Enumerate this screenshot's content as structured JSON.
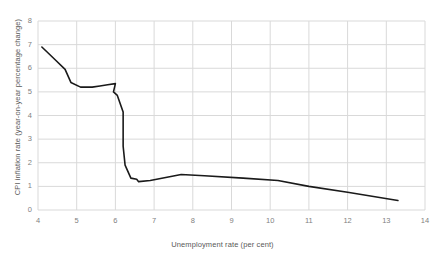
{
  "chart_data": {
    "type": "line",
    "title": "",
    "xlabel": "Unemployment rate (per cent)",
    "ylabel": "CPI inflation rate (year-on-year percentage change)",
    "xlim": [
      4,
      14
    ],
    "ylim": [
      0,
      8
    ],
    "xticks": [
      4,
      5,
      6,
      7,
      8,
      9,
      10,
      11,
      12,
      13,
      14
    ],
    "yticks": [
      0,
      1,
      2,
      3,
      4,
      5,
      6,
      7,
      8
    ],
    "grid": "both",
    "legend": "none",
    "series": [
      {
        "name": "CPI inflation vs unemployment",
        "color": "#1a1a1a",
        "points": [
          {
            "x": 4.1,
            "y": 6.9
          },
          {
            "x": 4.45,
            "y": 6.35
          },
          {
            "x": 4.7,
            "y": 5.95
          },
          {
            "x": 4.85,
            "y": 5.4
          },
          {
            "x": 5.1,
            "y": 5.2
          },
          {
            "x": 5.4,
            "y": 5.2
          },
          {
            "x": 5.6,
            "y": 5.25
          },
          {
            "x": 5.8,
            "y": 5.3
          },
          {
            "x": 6.0,
            "y": 5.35
          },
          {
            "x": 5.95,
            "y": 5.0
          },
          {
            "x": 6.05,
            "y": 4.85
          },
          {
            "x": 6.2,
            "y": 4.15
          },
          {
            "x": 6.2,
            "y": 2.7
          },
          {
            "x": 6.25,
            "y": 1.9
          },
          {
            "x": 6.4,
            "y": 1.35
          },
          {
            "x": 6.55,
            "y": 1.3
          },
          {
            "x": 6.6,
            "y": 1.2
          },
          {
            "x": 6.9,
            "y": 1.25
          },
          {
            "x": 7.7,
            "y": 1.5
          },
          {
            "x": 8.3,
            "y": 1.45
          },
          {
            "x": 9.3,
            "y": 1.35
          },
          {
            "x": 10.2,
            "y": 1.25
          },
          {
            "x": 11.0,
            "y": 1.0
          },
          {
            "x": 12.0,
            "y": 0.75
          },
          {
            "x": 13.3,
            "y": 0.4
          }
        ]
      }
    ],
    "colors": {
      "line": "#1a1a1a",
      "grid": "#d9d9d9",
      "tick_text": "#7f7f7f",
      "axis_title_text": "#595959",
      "background": "#ffffff"
    }
  }
}
